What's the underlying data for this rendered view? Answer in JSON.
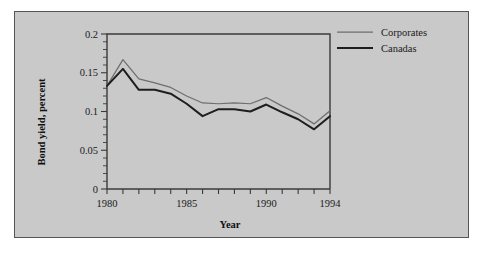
{
  "chart_data": {
    "type": "line",
    "title": "",
    "xlabel": "Year",
    "ylabel": "Bond yield, percent",
    "xlim": [
      1980,
      1994
    ],
    "ylim": [
      0,
      0.2
    ],
    "grid": false,
    "legend_position": "top-right",
    "x": [
      1980,
      1981,
      1982,
      1983,
      1984,
      1985,
      1986,
      1987,
      1988,
      1989,
      1990,
      1991,
      1992,
      1993,
      1994
    ],
    "xticklabels": [
      "1980",
      "1985",
      "1990",
      "1994"
    ],
    "xticklabel_values": [
      1980,
      1985,
      1990,
      1994
    ],
    "yticklabels": [
      "0",
      "0.05",
      "0.1",
      "0.15",
      "0.2"
    ],
    "yticklabel_values": [
      0,
      0.05,
      0.1,
      0.15,
      0.2
    ],
    "ytick_minor_step": 0.01,
    "series": [
      {
        "name": "Corporates",
        "color": "#6e6e6e",
        "values": [
          0.133,
          0.167,
          0.142,
          0.137,
          0.131,
          0.12,
          0.111,
          0.11,
          0.111,
          0.11,
          0.118,
          0.107,
          0.097,
          0.084,
          0.101
        ]
      },
      {
        "name": "Canadas",
        "color": "#1e1e1e",
        "values": [
          0.133,
          0.155,
          0.128,
          0.128,
          0.123,
          0.11,
          0.094,
          0.103,
          0.103,
          0.1,
          0.109,
          0.099,
          0.09,
          0.077,
          0.094
        ]
      }
    ]
  },
  "legend": {
    "items": [
      {
        "label": "Corporates"
      },
      {
        "label": "Canadas"
      }
    ]
  },
  "colors": {
    "background": "#c9c9c9",
    "page": "#ffffff",
    "frame": "#555555",
    "axis": "#3a3a3a",
    "corporates": "#6e6e6e",
    "canadas": "#1e1e1e"
  }
}
